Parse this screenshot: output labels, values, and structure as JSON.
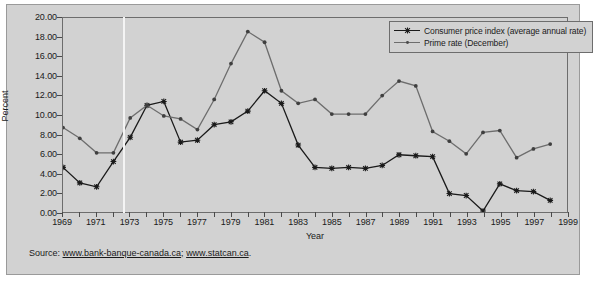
{
  "chart_data": {
    "type": "line",
    "title": "",
    "xlabel": "Year",
    "ylabel": "Percent",
    "xlim": [
      1969,
      1999
    ],
    "ylim": [
      0,
      20
    ],
    "ytick_step": 2,
    "yticks": [
      "0.00",
      "2.00",
      "4.00",
      "6.00",
      "8.00",
      "10.00",
      "12.00",
      "14.00",
      "16.00",
      "18.00",
      "20.00"
    ],
    "xticks_labeled": [
      "1969",
      "1971",
      "1973",
      "1975",
      "1977",
      "1979",
      "1981",
      "1983",
      "1985",
      "1987",
      "1989",
      "1991",
      "1993",
      "1995",
      "1997",
      "1999"
    ],
    "xtick_label_step": 2,
    "xtick_minor_step": 1,
    "grid": false,
    "legend_position": "top-right",
    "x": [
      1969,
      1970,
      1971,
      1972,
      1973,
      1974,
      1975,
      1976,
      1977,
      1978,
      1979,
      1980,
      1981,
      1982,
      1983,
      1984,
      1985,
      1986,
      1987,
      1988,
      1989,
      1990,
      1991,
      1992,
      1993,
      1994,
      1995,
      1996,
      1997,
      1998
    ],
    "series": [
      {
        "name": "Consumer price index (average annual rate)",
        "marker": "x",
        "color": "#1a1a1a",
        "values": [
          4.6,
          3.0,
          2.6,
          5.2,
          7.7,
          11.0,
          11.4,
          7.2,
          7.4,
          9.0,
          9.3,
          10.4,
          12.5,
          11.2,
          6.9,
          4.6,
          4.5,
          4.6,
          4.5,
          4.8,
          5.9,
          5.8,
          5.7,
          1.9,
          1.7,
          0.1,
          2.9,
          2.2,
          2.1,
          1.2
        ]
      },
      {
        "name": "Prime rate (December)",
        "marker": "o",
        "color": "#6d6d6d",
        "values": [
          8.7,
          7.6,
          6.1,
          6.1,
          9.7,
          11.0,
          9.9,
          9.6,
          8.5,
          11.6,
          15.3,
          18.6,
          17.5,
          12.5,
          11.2,
          11.6,
          10.1,
          10.1,
          10.1,
          12.0,
          13.5,
          13.0,
          8.3,
          7.3,
          6.0,
          8.2,
          8.4,
          5.6,
          6.5,
          7.0
        ]
      }
    ],
    "reference_line_x": 1972.6
  },
  "legend": {
    "items": [
      {
        "label": "Consumer price index (average annual rate)"
      },
      {
        "label": "Prime rate (December)"
      }
    ]
  },
  "source": {
    "prefix": "Source: ",
    "link1": "www.bank-banque-canada.ca",
    "separator": "; ",
    "link2": "www.statcan.ca",
    "suffix": "."
  }
}
